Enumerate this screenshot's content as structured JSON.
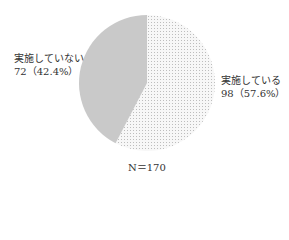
{
  "chart_data": {
    "type": "pie",
    "title": "",
    "categories": [
      "実施している",
      "実施していない"
    ],
    "values": [
      98,
      72
    ],
    "percentages": [
      57.6,
      42.4
    ],
    "total_label": "N＝170",
    "total": 170,
    "colors": {
      "実施している": "#f2f2f2 (dotted pattern)",
      "実施していない": "#c8c8c8"
    },
    "start_angle": "12 o'clock, clockwise",
    "legend": "none (direct labels)"
  },
  "labels": {
    "no": {
      "name": "実施していない",
      "value": "72（42.4%）"
    },
    "yes": {
      "name": "実施している",
      "value": "98（57.6%）"
    },
    "n": "N＝170"
  }
}
